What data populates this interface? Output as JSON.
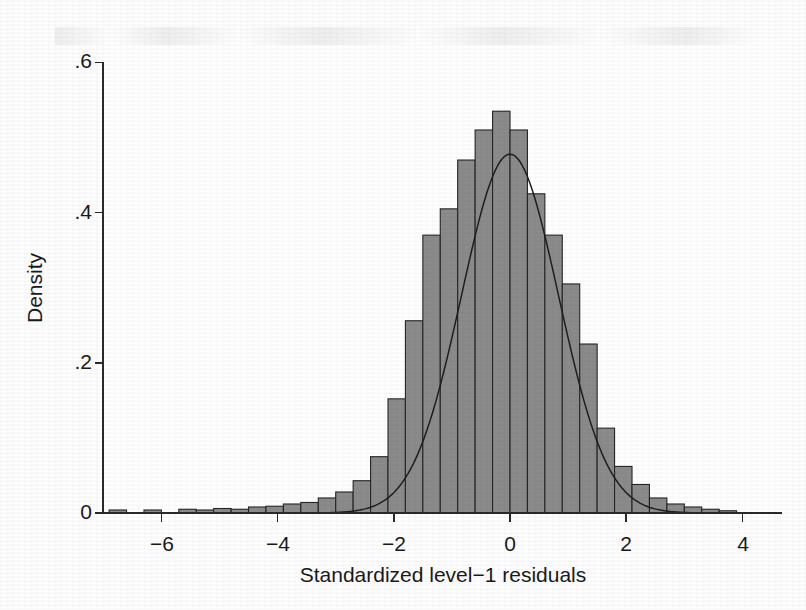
{
  "chart_data": {
    "type": "bar",
    "title": "",
    "subtitle": "",
    "xlabel": "Standardized level−1 residuals",
    "ylabel": "Density",
    "xlim": [
      -7.0,
      4.2
    ],
    "ylim": [
      0,
      0.62
    ],
    "xticks": [
      -6,
      -4,
      -2,
      0,
      2,
      4
    ],
    "xticklabels": [
      "−6",
      "−4",
      "−2",
      "0",
      "2",
      "4"
    ],
    "yticks": [
      0,
      0.2,
      0.4,
      0.6
    ],
    "yticklabels": [
      "0",
      ".2",
      ".4",
      ".6"
    ],
    "grid": false,
    "legend": "none",
    "bin_width": 0.3,
    "bar_fill_color": "#8b8b8b",
    "bar_edge_color": "#262626",
    "curve_color": "#1f1f1f",
    "bin_centers": [
      -6.75,
      -6.45,
      -6.15,
      -5.85,
      -5.55,
      -5.25,
      -4.95,
      -4.65,
      -4.35,
      -4.05,
      -3.75,
      -3.45,
      -3.15,
      -2.85,
      -2.55,
      -2.25,
      -1.95,
      -1.65,
      -1.35,
      -1.05,
      -0.75,
      -0.45,
      -0.15,
      0.15,
      0.45,
      0.75,
      1.05,
      1.35,
      1.65,
      1.95,
      2.25,
      2.55,
      2.85,
      3.15,
      3.45,
      3.75
    ],
    "values": [
      0.004,
      0.0,
      0.004,
      0.0,
      0.005,
      0.004,
      0.006,
      0.005,
      0.008,
      0.009,
      0.012,
      0.014,
      0.02,
      0.028,
      0.043,
      0.075,
      0.152,
      0.256,
      0.37,
      0.405,
      0.47,
      0.51,
      0.535,
      0.51,
      0.425,
      0.37,
      0.305,
      0.225,
      0.113,
      0.062,
      0.038,
      0.02,
      0.012,
      0.008,
      0.005,
      0.003
    ],
    "overlay_curve": {
      "name": "normal-density",
      "distribution": "normal",
      "mean": 0.0,
      "sd": 0.835,
      "peak": 0.477
    }
  },
  "axes": {
    "x_axis_label": "Standardized level−1 residuals",
    "y_axis_label": "Density"
  }
}
